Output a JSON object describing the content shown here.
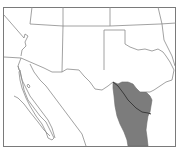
{
  "map": {
    "type": "range-map",
    "region": "Southwestern United States and northern Mexico",
    "colors": {
      "background": "#ffffff",
      "border": "#8a8a8a",
      "frame": "#7a7a7a",
      "range_fill": "#7c7c7c",
      "river": "#3a3a3a"
    },
    "layers": [
      {
        "name": "state-and-country-boundaries",
        "style": "thin gray outline"
      },
      {
        "name": "species-range",
        "style": "dark gray filled area",
        "location": "south Texas and northeastern Mexico"
      },
      {
        "name": "rio-grande-river",
        "style": "dark line through range"
      }
    ]
  }
}
